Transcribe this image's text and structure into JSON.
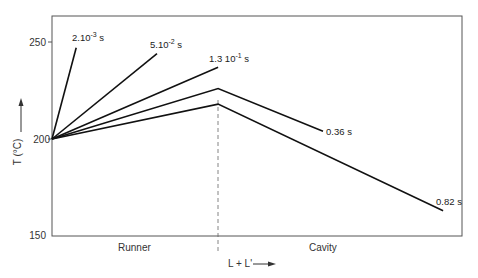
{
  "chart_data": {
    "type": "line",
    "title": "",
    "xlabel": "L + L'",
    "ylabel": "T (°C)",
    "ylim": [
      150,
      265
    ],
    "yticks": [
      150,
      200,
      250
    ],
    "xlim": [
      0,
      1
    ],
    "grid": false,
    "legend": "inline labels at line ends",
    "regions": [
      {
        "label": "Runner",
        "x_range": [
          0,
          0.405
        ]
      },
      {
        "label": "Cavity",
        "x_range": [
          0.405,
          1.0
        ]
      }
    ],
    "divider_x": 0.405,
    "series": [
      {
        "name": "2.10^-3 s",
        "label": "2.10",
        "exp": "-3",
        "unit": " s",
        "points": [
          [
            0,
            200
          ],
          [
            0.059,
            247
          ]
        ]
      },
      {
        "name": "5.10^-2 s",
        "label": "5.10",
        "exp": "-2",
        "unit": " s",
        "points": [
          [
            0,
            200
          ],
          [
            0.256,
            244
          ]
        ]
      },
      {
        "name": "1.3 10^-1 s",
        "label": "1.3 10",
        "exp": "-1",
        "unit": " s",
        "points": [
          [
            0,
            200
          ],
          [
            0.405,
            237
          ]
        ]
      },
      {
        "name": "0.36 s",
        "label": "0.36 s",
        "exp": "",
        "unit": "",
        "points": [
          [
            0,
            200
          ],
          [
            0.405,
            226
          ],
          [
            0.661,
            204
          ]
        ]
      },
      {
        "name": "0.82 s",
        "label": "0.82 s",
        "exp": "",
        "unit": "",
        "points": [
          [
            0,
            200
          ],
          [
            0.405,
            218
          ],
          [
            0.954,
            163
          ]
        ]
      }
    ]
  },
  "axes": {
    "y_label": "T (°C)",
    "x_label": "L + L'",
    "ticks": [
      "250",
      "200",
      "150"
    ]
  },
  "regions": {
    "runner": "Runner",
    "cavity": "Cavity"
  },
  "series_labels": {
    "s1": {
      "base": "2.10",
      "exp": "-3",
      "unit": " s"
    },
    "s2": {
      "base": "5.10",
      "exp": "-2",
      "unit": " s"
    },
    "s3": {
      "base": "1.3 10",
      "exp": "-1",
      "unit": " s"
    },
    "s4": {
      "base": "0.36 s"
    },
    "s5": {
      "base": "0.82 s"
    }
  }
}
